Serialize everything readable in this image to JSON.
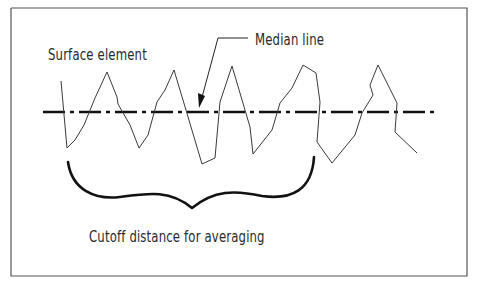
{
  "diagram": {
    "labels": {
      "surface_element": "Surface element",
      "median_line": "Median line",
      "cutoff_distance": "Cutoff distance for averaging"
    },
    "colors": {
      "line": "#1a1a1a",
      "profile": "#3a3a3a",
      "frame": "#555555",
      "background": "#ffffff"
    },
    "elements": [
      {
        "name": "frame",
        "type": "rectangle"
      },
      {
        "name": "surface-profile",
        "type": "jagged-wave",
        "peaks": 5
      },
      {
        "name": "median-line",
        "type": "dash-dot-line"
      },
      {
        "name": "median-leader-arrow",
        "type": "leader-arrow"
      },
      {
        "name": "cutoff-brace",
        "type": "curly-brace"
      }
    ]
  }
}
